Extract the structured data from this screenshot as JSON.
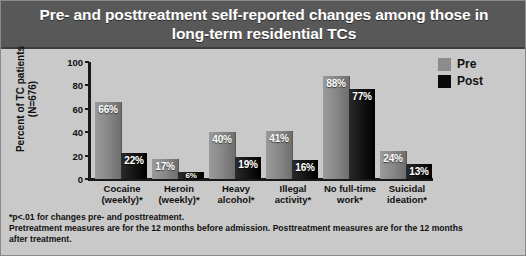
{
  "title": "Pre- and posttreatment self-reported changes among those in long-term residential TCs",
  "axis": {
    "y_title_line1": "Percent of TC patients",
    "y_title_line2": "(N=676)",
    "y_ticks": [
      "100",
      "80",
      "60",
      "40",
      "20",
      "0"
    ]
  },
  "legend": {
    "position": "top-right",
    "items": [
      {
        "label": "Pre",
        "color": "#8c8c8c"
      },
      {
        "label": "Post",
        "color": "#0a0a0a"
      }
    ]
  },
  "footnote": {
    "line1": "*p<.01 for changes pre- and posttreatment.",
    "line2": "Pretreatment measures are for the 12 months before admission. Posttreatment measures are for the 12 months",
    "line3": "after treatment."
  },
  "chart_data": {
    "type": "bar",
    "title": "Pre- and posttreatment self-reported changes among those in long-term residential TCs",
    "xlabel": "",
    "ylabel": "Percent of TC patients (N=676)",
    "ylim": [
      0,
      100
    ],
    "yticks": [
      0,
      20,
      40,
      60,
      80,
      100
    ],
    "grid": false,
    "legend_position": "top-right",
    "categories": [
      "Cocaine (weekly)*",
      "Heroin (weekly)*",
      "Heavy alcohol*",
      "Illegal activity*",
      "No full-time work*",
      "Suicidal ideation*"
    ],
    "category_lines": [
      [
        "Cocaine",
        "(weekly)*"
      ],
      [
        "Heroin",
        "(weekly)*"
      ],
      [
        "Heavy",
        "alcohol*"
      ],
      [
        "Illegal",
        "activity*"
      ],
      [
        "No full-time",
        "work*"
      ],
      [
        "Suicidal",
        "ideation*"
      ]
    ],
    "series": [
      {
        "name": "Pre",
        "color": "#8c8c8c",
        "values": [
          66,
          17,
          40,
          41,
          88,
          24
        ],
        "labels": [
          "66%",
          "17%",
          "40%",
          "41%",
          "88%",
          "24%"
        ]
      },
      {
        "name": "Post",
        "color": "#0a0a0a",
        "values": [
          22,
          6,
          19,
          16,
          77,
          13
        ],
        "labels": [
          "22%",
          "6%",
          "19%",
          "16%",
          "77%",
          "13%"
        ]
      }
    ]
  }
}
